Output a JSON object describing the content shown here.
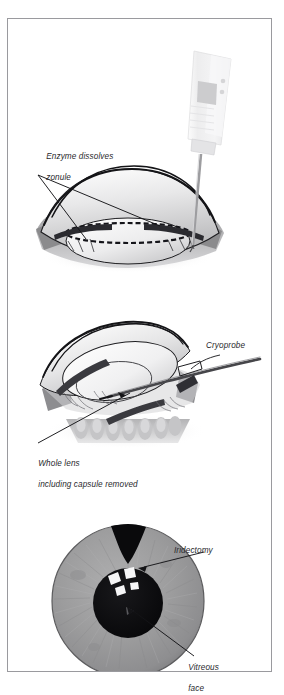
{
  "figure": {
    "background_color": "#ffffff",
    "frame_color": "#9a9a9e",
    "panel_count": 3
  },
  "panels": [
    {
      "id": "panel-enzymatic-zonulolysis",
      "label_text": "Enzyme dissolves\nzonule",
      "labels": [
        {
          "name": "enzyme-dissolves-zonule",
          "text": "Enzyme dissolves\nzonule"
        }
      ],
      "instruments": [
        {
          "name": "syringe",
          "color": "#ededef"
        },
        {
          "name": "needle",
          "color": "#b8b8bc"
        }
      ],
      "anatomy": [
        "cornea",
        "iris",
        "lens-capsule",
        "zonule",
        "sclera"
      ]
    },
    {
      "id": "panel-cryoextraction",
      "labels": [
        {
          "name": "cryoprobe",
          "text": "Cryoprobe"
        },
        {
          "name": "whole-lens-removed",
          "text": "Whole lens\nincluding capsule removed"
        }
      ],
      "instruments": [
        {
          "name": "cryoprobe",
          "color": "#4a4a4e"
        },
        {
          "name": "forceps",
          "color": "#3a3a3e"
        }
      ],
      "anatomy": [
        "cornea",
        "iris",
        "lens",
        "ciliary-processes",
        "broken-zonules"
      ]
    },
    {
      "id": "panel-postoperative-front-view",
      "labels": [
        {
          "name": "iridectomy",
          "text": "Iridectomy"
        },
        {
          "name": "vitreous-face",
          "text": "Vitreous\nface"
        }
      ],
      "anatomy": [
        "iris",
        "pupil",
        "iridectomy-notch",
        "vitreous-face",
        "corneal-reflex"
      ],
      "iris_color": "#9d9d9e",
      "pupil_color": "#0d0d0f"
    }
  ],
  "text": {
    "enzyme_line1": "Enzyme dissolves",
    "enzyme_line2": "zonule",
    "cryoprobe": "Cryoprobe",
    "whole_lens_line1": "Whole lens",
    "whole_lens_line2": "including capsule removed",
    "iridectomy": "Iridectomy",
    "vitreous_line1": "Vitreous",
    "vitreous_line2": "face"
  }
}
